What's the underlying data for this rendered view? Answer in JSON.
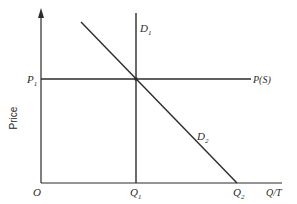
{
  "diagram": {
    "type": "supply-demand",
    "y_axis_label": "Price",
    "x_axis_label": "Q/T",
    "origin_label": "O",
    "price_level": {
      "label": "P",
      "subscript": "1"
    },
    "supply_curve": {
      "label": "P(S)",
      "orientation": "horizontal"
    },
    "demand_curves": [
      {
        "label": "D",
        "subscript": "1",
        "orientation": "vertical"
      },
      {
        "label": "D",
        "subscript": "2",
        "orientation": "downward-sloping"
      }
    ],
    "quantity_ticks": [
      {
        "label": "Q",
        "subscript": "1"
      },
      {
        "label": "Q",
        "subscript": "2"
      }
    ],
    "colors": {
      "ink": "#2b2b2b",
      "background": "#ffffff"
    }
  }
}
